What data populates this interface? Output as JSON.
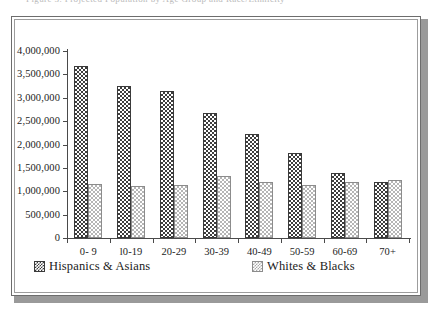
{
  "top_clip_text": "Figure 3. Projected Population by Age Group and Race/Ethnicity",
  "frame": {
    "border_outer_color": "#6d6d6d",
    "border_inner_color": "#9d9d9d",
    "shadow_color": "#9a9a9a",
    "background": "#ffffff"
  },
  "chart_data": {
    "type": "bar",
    "title": "",
    "subtitle": "",
    "xlabel": "",
    "ylabel": "",
    "ylim": [
      0,
      4000000
    ],
    "ytick_values": [
      0,
      500000,
      1000000,
      1500000,
      2000000,
      2500000,
      3000000,
      3500000,
      4000000
    ],
    "ytick_labels": [
      "0",
      "500,000",
      "1,000,000",
      "1,500,000",
      "2,000,000",
      "2,500,000",
      "3,000,000",
      "3,500,000",
      "4,000,000"
    ],
    "grid": false,
    "legend_position": "bottom",
    "categories": [
      "0- 9",
      "l0-19",
      "20-29",
      "30-39",
      "40-49",
      "50-59",
      "60-69",
      "70+"
    ],
    "series": [
      {
        "name": "Hispanics & Asians",
        "color": "#3d3d3d",
        "pattern": "dark-checker",
        "values": [
          3670000,
          3250000,
          3150000,
          2670000,
          2225000,
          1810000,
          1400000,
          1190000
        ]
      },
      {
        "name": "Whites & Blacks",
        "color": "#b5b5b5",
        "pattern": "light-checker",
        "values": [
          1155000,
          1120000,
          1140000,
          1320000,
          1190000,
          1130000,
          1190000,
          1250000
        ]
      }
    ]
  }
}
